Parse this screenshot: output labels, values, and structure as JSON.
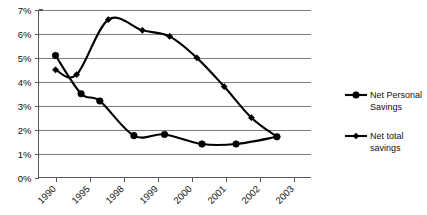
{
  "chart_data": {
    "type": "line",
    "title": "",
    "subtitle": "",
    "xlabel": "",
    "ylabel": "",
    "ylim": [
      0,
      7
    ],
    "y_ticks": [
      "0%",
      "1%",
      "2%",
      "3%",
      "4%",
      "5%",
      "6%",
      "7%"
    ],
    "y_tick_values": [
      0,
      1,
      2,
      3,
      4,
      5,
      6,
      7
    ],
    "grid": "horizontal",
    "legend_position": "right",
    "categories": [
      "1990",
      "1995",
      "1998",
      "1999",
      "2000",
      "2001",
      "2002",
      "2003"
    ],
    "x_tick_labels": [
      "1990",
      "1995",
      "1998",
      "1999",
      "2000",
      "2001",
      "2002",
      "2003"
    ],
    "x_tick_rotation": "-45",
    "series": [
      {
        "name": "Net Personal Savings",
        "marker": "circle",
        "color": "#000000",
        "points": [
          {
            "x": 0.0,
            "y": 5.1
          },
          {
            "x": 0.75,
            "y": 3.5
          },
          {
            "x": 1.3,
            "y": 3.2
          },
          {
            "x": 2.3,
            "y": 1.75
          },
          {
            "x": 3.2,
            "y": 1.8
          },
          {
            "x": 4.3,
            "y": 1.4
          },
          {
            "x": 5.3,
            "y": 1.4
          },
          {
            "x": 6.5,
            "y": 1.7
          }
        ]
      },
      {
        "name": "Net total savings",
        "marker": "diamond",
        "color": "#000000",
        "points": [
          {
            "x": 0.0,
            "y": 4.5
          },
          {
            "x": 0.62,
            "y": 4.3
          },
          {
            "x": 1.55,
            "y": 6.6
          },
          {
            "x": 2.55,
            "y": 6.15
          },
          {
            "x": 3.35,
            "y": 5.9
          },
          {
            "x": 4.15,
            "y": 5.0
          },
          {
            "x": 4.95,
            "y": 3.8
          },
          {
            "x": 5.75,
            "y": 2.5
          },
          {
            "x": 6.5,
            "y": 1.7
          }
        ]
      }
    ],
    "legend": [
      {
        "label_line1": "Net Personal",
        "label_line2": "Savings",
        "marker": "circle"
      },
      {
        "label_line1": "Net total",
        "label_line2": "savings",
        "marker": "diamond"
      }
    ]
  }
}
